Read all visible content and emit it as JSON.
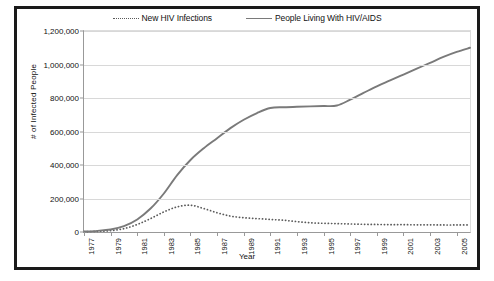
{
  "chart_data": {
    "type": "line",
    "title": "",
    "xlabel": "Year",
    "ylabel": "# of Infected People",
    "xlim": [
      1977,
      2006
    ],
    "ylim": [
      0,
      1200000
    ],
    "grid": true,
    "legend_position": "top",
    "x": [
      1977,
      1978,
      1979,
      1980,
      1981,
      1982,
      1983,
      1984,
      1985,
      1986,
      1987,
      1988,
      1989,
      1990,
      1991,
      1992,
      1993,
      1994,
      1995,
      1996,
      1997,
      1998,
      1999,
      2000,
      2001,
      2002,
      2003,
      2004,
      2005,
      2006
    ],
    "y_tick_labels": [
      "0",
      "200,000",
      "400,000",
      "600,000",
      "800,000",
      "1,000,000",
      "1,200,000"
    ],
    "y_tick_values": [
      0,
      200000,
      400000,
      600000,
      800000,
      1000000,
      1200000
    ],
    "x_tick_labels": [
      "1977",
      "1979",
      "1981",
      "1983",
      "1985",
      "1987",
      "1989",
      "1991",
      "1993",
      "1995",
      "1997",
      "1999",
      "2001",
      "2003",
      "2005"
    ],
    "x_tick_values": [
      1977,
      1979,
      1981,
      1983,
      1985,
      1987,
      1989,
      1991,
      1993,
      1995,
      1997,
      1999,
      2001,
      2003,
      2005
    ],
    "series": [
      {
        "name": "New HIV Infections",
        "style": "dotted",
        "color": "#5a5a5a",
        "values": [
          2000,
          4000,
          8000,
          20000,
          45000,
          80000,
          120000,
          150000,
          160000,
          140000,
          115000,
          95000,
          85000,
          80000,
          75000,
          70000,
          62000,
          55000,
          52000,
          50000,
          48000,
          46000,
          45000,
          44000,
          44000,
          43000,
          43000,
          42000,
          42000,
          42000
        ]
      },
      {
        "name": "People Living With HIV/AIDS",
        "style": "solid",
        "color": "#7a7a7a",
        "values": [
          3000,
          7000,
          15000,
          35000,
          75000,
          140000,
          230000,
          340000,
          430000,
          500000,
          560000,
          620000,
          670000,
          710000,
          740000,
          745000,
          748000,
          750000,
          752000,
          755000,
          790000,
          830000,
          870000,
          905000,
          940000,
          975000,
          1010000,
          1045000,
          1075000,
          1100000
        ]
      }
    ]
  },
  "legend": {
    "entries": [
      {
        "label": "New HIV Infections",
        "style": "dotted"
      },
      {
        "label": "People Living With HIV/AIDS",
        "style": "solid"
      }
    ]
  }
}
